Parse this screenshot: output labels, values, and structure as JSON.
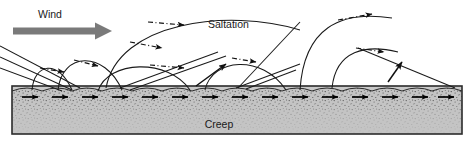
{
  "figure": {
    "name": "aeolian-sand-transport-diagram",
    "background_color": "#ffffff",
    "width": 474,
    "height": 145
  },
  "labels": {
    "wind": "Wind",
    "saltation": "Saltation",
    "creep": "Creep"
  },
  "colors": {
    "wind_arrow": "#7a7a7a",
    "ground_fill": "#c9c9c9",
    "ground_top_fill": "#b8b8b8",
    "ground_border": "#2b2b2b",
    "stroke": "#1a1a1a",
    "text": "#1a1a1a"
  },
  "wind_arrow": {
    "icon": "thick-right-arrow-icon",
    "x1": 13,
    "y1": 31,
    "x2": 108,
    "y2": 31,
    "thickness": 7,
    "head_width": 13,
    "head_height": 17
  },
  "ground": {
    "box": {
      "x": 12,
      "y": 86,
      "width": 450,
      "height": 48
    },
    "ripple_count": 15,
    "ripple_amplitude": 5,
    "stipple_density": "dense-top-fading-down"
  },
  "creep_arrows": {
    "icon": "creep-arrow-icon",
    "count": 15,
    "y": 96,
    "start_x": 22,
    "spacing": 30,
    "length": 18,
    "color": "#000000"
  },
  "saltation_arcs": [
    {
      "id": "arc-1",
      "start_x": 30,
      "apex_x": 55,
      "apex_y": 58,
      "end_x": 80,
      "peak_height": 30
    },
    {
      "id": "arc-2",
      "start_x": 62,
      "apex_x": 95,
      "apex_y": 52,
      "end_x": 128,
      "peak_height": 36
    },
    {
      "id": "arc-3",
      "start_x": 100,
      "apex_x": 145,
      "apex_y": 62,
      "end_x": 190,
      "peak_height": 26
    },
    {
      "id": "arc-4",
      "start_x": 108,
      "apex_x": 200,
      "apex_y": 18,
      "end_x": 300,
      "peak_height": 70
    },
    {
      "id": "arc-5",
      "start_x": 205,
      "apex_x": 245,
      "apex_y": 58,
      "end_x": 285,
      "peak_height": 30
    },
    {
      "id": "arc-6",
      "start_x": 300,
      "apex_x": 345,
      "apex_y": 20,
      "end_x": 400,
      "peak_height": 68
    },
    {
      "id": "arc-7",
      "start_x": 330,
      "apex_x": 365,
      "apex_y": 48,
      "end_x": 400,
      "peak_height": 40
    }
  ],
  "impact_lines": [
    {
      "id": "impact-1",
      "x1": 0,
      "y1": 48,
      "x2": 78,
      "y2": 86
    },
    {
      "id": "impact-2",
      "x1": 0,
      "y1": 58,
      "x2": 70,
      "y2": 88
    },
    {
      "id": "impact-3",
      "x1": 0,
      "y1": 68,
      "x2": 60,
      "y2": 90
    },
    {
      "id": "impact-4",
      "x1": 120,
      "y1": 86,
      "x2": 300,
      "y2": 22
    },
    {
      "id": "impact-5",
      "x1": 128,
      "y1": 88,
      "x2": 232,
      "y2": 52
    },
    {
      "id": "impact-6",
      "x1": 238,
      "y1": 88,
      "x2": 300,
      "y2": 66
    },
    {
      "id": "impact-7",
      "x1": 245,
      "y1": 88,
      "x2": 292,
      "y2": 70
    },
    {
      "id": "impact-8",
      "x1": 455,
      "y1": 86,
      "x2": 352,
      "y2": 46
    }
  ],
  "trajectory_markers": {
    "style": "dash-dot-with-arrowhead",
    "description": "small solid arrowheads along arcs and impact lines indicating grain direction"
  }
}
